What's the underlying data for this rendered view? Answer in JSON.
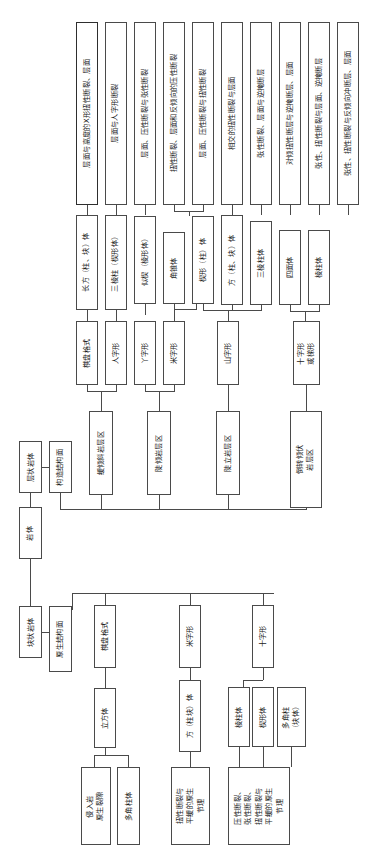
{
  "diagram": {
    "orientation": "rotated-90-ccw",
    "accent": "#4a4a4a",
    "root": {
      "label": "岩体"
    },
    "branches": {
      "layered": {
        "label": "层状岩体",
        "structure_plane": "构造结构面",
        "zones": [
          {
            "label": "缓倾斜岩层区"
          },
          {
            "label": "陡倾岩层区"
          },
          {
            "label": "陡立岩层区"
          },
          {
            "label": "倒转倾伏\n岩层区"
          }
        ],
        "patterns": [
          {
            "label": "棋盘格式"
          },
          {
            "label": "人字形"
          },
          {
            "label": "丫字形"
          },
          {
            "label": "米字形"
          },
          {
            "label": "山字形"
          },
          {
            "label": "十字形\n或梯形"
          }
        ],
        "bodies": [
          {
            "label": "长方（柱、块）体"
          },
          {
            "label": "三棱柱（楔形体）"
          },
          {
            "label": "似楔（棱形体）"
          },
          {
            "label": "角锥体"
          },
          {
            "label": "楔形（柱）体"
          },
          {
            "label": "方（柱、块）体"
          },
          {
            "label": "三棱柱体"
          },
          {
            "label": "四面体"
          },
          {
            "label": "棱柱体"
          }
        ],
        "combinations": [
          {
            "label": "层面与高度的X形扭性断裂、层面"
          },
          {
            "label": "层面与人字形断裂"
          },
          {
            "label": "层面、压性断裂与张性断裂"
          },
          {
            "label": "扭性断裂、层面和反倾向的压性断裂"
          },
          {
            "label": "层面、压性断裂与扭性断裂"
          },
          {
            "label": "相交的扭性断裂与层面"
          },
          {
            "label": "张性断裂、层面与逆掩断层"
          },
          {
            "label": "对倾扭性断层与逆掩断层、层面"
          },
          {
            "label": "张性、扭性断裂与层面、逆掩断层"
          },
          {
            "label": "张性、扭性断裂与反倾向冲断层、层面"
          }
        ]
      },
      "massive": {
        "label": "块状岩体",
        "structure_plane": "原生结构面",
        "patterns": [
          {
            "label": "棋盘格式"
          },
          {
            "label": "米字形"
          },
          {
            "label": "十字形"
          }
        ],
        "bodies": [
          {
            "label": "立方体"
          },
          {
            "label": "方（柱块）体"
          },
          {
            "label": "棱柱体"
          },
          {
            "label": "楔形体"
          },
          {
            "label": "多角柱\n（块体）"
          }
        ],
        "combinations": [
          {
            "label": "侵入岩\n原生裂隙"
          },
          {
            "label": "多角柱体"
          },
          {
            "label": "扭性断裂与\n平缓的原生\n节理"
          },
          {
            "label": "压性断裂、\n张性断裂、\n扭性断裂与\n平缓的原生\n节理"
          }
        ]
      }
    }
  }
}
